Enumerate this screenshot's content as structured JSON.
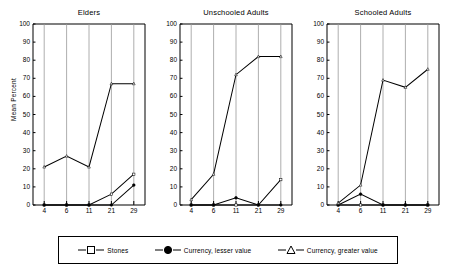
{
  "chart_data": {
    "type": "line",
    "title": "",
    "xlabel": "",
    "ylabel": "Mean Percent",
    "categories": [
      "4",
      "6",
      "11",
      "21",
      "29"
    ],
    "x": [
      4,
      6,
      11,
      21,
      29
    ],
    "ylim": [
      0,
      100
    ],
    "yticks": [
      0,
      10,
      20,
      30,
      40,
      50,
      60,
      70,
      80,
      90,
      100
    ],
    "grid": "vertical",
    "legend_position": "bottom",
    "panels": [
      {
        "title": "Elders",
        "series": [
          {
            "name": "Stones",
            "marker": "open-square",
            "values": [
              0,
              0,
              0,
              6,
              17
            ]
          },
          {
            "name": "Currency, lesser value",
            "marker": "filled-circle",
            "values": [
              0,
              0,
              0,
              0,
              11
            ]
          },
          {
            "name": "Currency, greater value",
            "marker": "open-triangle",
            "values": [
              21,
              27,
              21,
              67,
              67
            ]
          }
        ]
      },
      {
        "title": "Unschooled Adults",
        "series": [
          {
            "name": "Stones",
            "marker": "open-square",
            "values": [
              0,
              0,
              0,
              0,
              14
            ]
          },
          {
            "name": "Currency, lesser value",
            "marker": "filled-circle",
            "values": [
              0,
              0,
              4,
              0,
              0
            ]
          },
          {
            "name": "Currency, greater value",
            "marker": "open-triangle",
            "values": [
              3,
              17,
              72,
              82,
              82
            ]
          }
        ]
      },
      {
        "title": "Schooled Adults",
        "series": [
          {
            "name": "Stones",
            "marker": "open-square",
            "values": [
              0,
              0,
              0,
              0,
              0
            ]
          },
          {
            "name": "Currency, lesser value",
            "marker": "filled-circle",
            "values": [
              0,
              6,
              0,
              0,
              0
            ]
          },
          {
            "name": "Currency, greater value",
            "marker": "open-triangle",
            "values": [
              1,
              11,
              69,
              65,
              75
            ]
          }
        ]
      }
    ],
    "legend": [
      {
        "label": "Stones",
        "marker": "open-square"
      },
      {
        "label": "Currency, lesser value",
        "marker": "filled-circle"
      },
      {
        "label": "Currency, greater value",
        "marker": "open-triangle"
      }
    ],
    "colors": {
      "line": "#000000",
      "fill_open": "#ffffff",
      "fill_solid": "#000000",
      "grid": "#999999",
      "axis": "#000000"
    }
  }
}
